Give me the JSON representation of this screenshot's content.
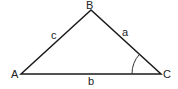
{
  "diagram": {
    "vertices": {
      "A": "A",
      "B": "B",
      "C": "C"
    },
    "sides": {
      "a": "a",
      "b": "b",
      "c": "c"
    },
    "angle_marked": "C",
    "colors": {
      "stroke": "#1a1a1a",
      "background": "#ffffff"
    }
  }
}
